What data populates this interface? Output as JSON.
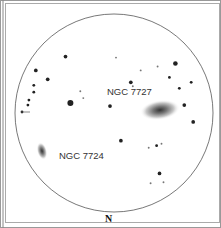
{
  "chart": {
    "title": "",
    "labels": {
      "galaxy_a": "NGC 7727",
      "galaxy_b": "NGC 7724",
      "orientation": "N"
    },
    "colors": {
      "ink": "#222222",
      "border": "#888888",
      "background": "#ffffff"
    },
    "stars": [
      {
        "x": 0.255,
        "y": 0.215,
        "mag": 3
      },
      {
        "x": 0.105,
        "y": 0.285,
        "mag": 3
      },
      {
        "x": 0.165,
        "y": 0.33,
        "mag": 3
      },
      {
        "x": 0.095,
        "y": 0.36,
        "mag": 2
      },
      {
        "x": 0.095,
        "y": 0.395,
        "mag": 2
      },
      {
        "x": 0.07,
        "y": 0.435,
        "mag": 2
      },
      {
        "x": 0.065,
        "y": 0.46,
        "mag": 2
      },
      {
        "x": 0.33,
        "y": 0.39,
        "mag": 1
      },
      {
        "x": 0.345,
        "y": 0.425,
        "mag": 1
      },
      {
        "x": 0.28,
        "y": 0.45,
        "mag": 6
      },
      {
        "x": 0.51,
        "y": 0.22,
        "mag": 1
      },
      {
        "x": 0.635,
        "y": 0.285,
        "mag": 1
      },
      {
        "x": 0.72,
        "y": 0.265,
        "mag": 1
      },
      {
        "x": 0.585,
        "y": 0.345,
        "mag": 3
      },
      {
        "x": 0.595,
        "y": 0.365,
        "mag": 1
      },
      {
        "x": 0.48,
        "y": 0.465,
        "mag": 3
      },
      {
        "x": 0.81,
        "y": 0.25,
        "mag": 4
      },
      {
        "x": 0.78,
        "y": 0.32,
        "mag": 2
      },
      {
        "x": 0.89,
        "y": 0.345,
        "mag": 2
      },
      {
        "x": 0.83,
        "y": 0.375,
        "mag": 2
      },
      {
        "x": 0.855,
        "y": 0.46,
        "mag": 3
      },
      {
        "x": 0.9,
        "y": 0.545,
        "mag": 3
      },
      {
        "x": 0.535,
        "y": 0.64,
        "mag": 3
      },
      {
        "x": 0.675,
        "y": 0.675,
        "mag": 1
      },
      {
        "x": 0.715,
        "y": 0.665,
        "mag": 2
      },
      {
        "x": 0.74,
        "y": 0.655,
        "mag": 1
      },
      {
        "x": 0.73,
        "y": 0.805,
        "mag": 3
      },
      {
        "x": 0.685,
        "y": 0.855,
        "mag": 1
      },
      {
        "x": 0.75,
        "y": 0.85,
        "mag": 1
      }
    ]
  }
}
